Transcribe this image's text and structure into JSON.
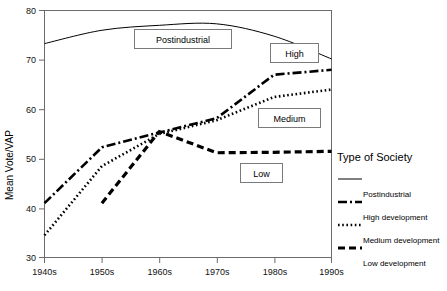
{
  "chart_data": {
    "type": "line",
    "title": "",
    "xlabel": "",
    "ylabel": "Mean Vote/VAP",
    "x": [
      "1940s",
      "1950s",
      "1960s",
      "1970s",
      "1980s",
      "1990s"
    ],
    "ylim": [
      30,
      80
    ],
    "yticks": [
      30,
      40,
      50,
      60,
      70,
      80
    ],
    "grid": false,
    "legend_position": "right",
    "series": [
      {
        "name": "Postindustrial",
        "style": "solid-thin",
        "values": [
          73.3,
          76.0,
          77.0,
          77.3,
          74.8,
          70.2
        ]
      },
      {
        "name": "High development",
        "style": "dash-dot",
        "values": [
          41.0,
          52.3,
          55.3,
          58.2,
          67.0,
          68.0
        ]
      },
      {
        "name": "Medium development",
        "style": "dotted",
        "values": [
          34.5,
          48.5,
          55.0,
          57.8,
          62.5,
          64.0
        ]
      },
      {
        "name": "Low development",
        "style": "dashed-thick",
        "values": [
          null,
          41.0,
          55.5,
          51.2,
          51.3,
          51.5
        ]
      }
    ],
    "annotations": [
      {
        "text": "Postindustrial",
        "series": "Postindustrial"
      },
      {
        "text": "High",
        "series": "High development"
      },
      {
        "text": "Medium",
        "series": "Medium development"
      },
      {
        "text": "Low",
        "series": "Low development"
      }
    ]
  },
  "legend": {
    "title": "Type of Society",
    "items": [
      {
        "label": "Postindustrial"
      },
      {
        "label": "High development"
      },
      {
        "label": "Medium development"
      },
      {
        "label": "Low development"
      }
    ]
  }
}
